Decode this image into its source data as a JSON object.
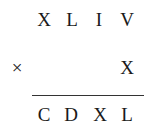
{
  "problem": {
    "multiplicand": [
      "X",
      "L",
      "I",
      "V"
    ],
    "operator": "×",
    "multiplier": [
      "X"
    ],
    "product": [
      "C",
      "D",
      "X",
      "L"
    ]
  }
}
